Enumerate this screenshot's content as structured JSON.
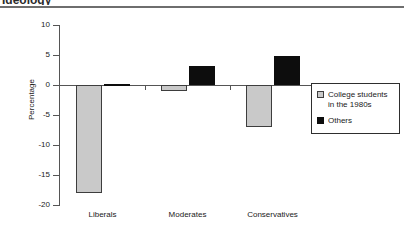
{
  "heading": "Ideology",
  "chart_data": {
    "type": "bar",
    "title": "",
    "xlabel": "",
    "ylabel": "Percentage",
    "ylim": [
      -20,
      10
    ],
    "yticks": [
      10,
      5,
      0,
      -5,
      -10,
      -15,
      -20
    ],
    "ytick_labels": [
      "10",
      "5",
      "0",
      "-5",
      "-10",
      "-15",
      "-20"
    ],
    "grid": false,
    "legend_position": "right",
    "categories": [
      "Liberals",
      "Moderates",
      "Conservatives"
    ],
    "series": [
      {
        "name": "College students\nin the 1980s",
        "legend_label": "College students\nin the 1980s",
        "swatch": "gray",
        "color": "#c9c9c9",
        "values": [
          -18,
          -1,
          -7
        ]
      },
      {
        "name": "Others",
        "legend_label": "Others",
        "swatch": "black",
        "color": "#0d0d0d",
        "values": [
          0.2,
          3.2,
          4.8
        ]
      }
    ]
  }
}
